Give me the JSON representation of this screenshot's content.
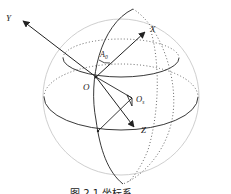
{
  "figure": {
    "type": "sphere-coordinate-system",
    "labels": {
      "y_axis": "Y",
      "x_axis": "X",
      "z_axis": "Z",
      "origin": "O",
      "angle": "A",
      "angle_sub": "0",
      "center": "O",
      "center_sub": "s"
    },
    "caption": "图 2.1  坐标系",
    "colors": {
      "line": "#222222",
      "sphere_outline": "#c8c8c8",
      "dotted": "#555555"
    }
  }
}
